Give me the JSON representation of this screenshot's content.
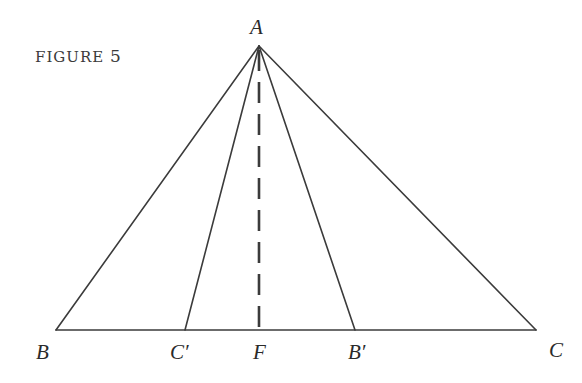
{
  "caption": {
    "word": "FIGURE",
    "number": "5"
  },
  "diagram": {
    "stroke_color": "#3b3b3b",
    "points": {
      "A": {
        "label": "A",
        "x": 259,
        "y": 46
      },
      "B": {
        "label": "B",
        "x": 56,
        "y": 330
      },
      "C": {
        "label": "C",
        "x": 536,
        "y": 330
      },
      "C_prime": {
        "label": "C′",
        "x": 185,
        "y": 330
      },
      "B_prime": {
        "label": "B′",
        "x": 355,
        "y": 330
      },
      "F": {
        "label": "F",
        "x": 259,
        "y": 330
      }
    },
    "segments": [
      {
        "from": "A",
        "to": "B",
        "style": "solid"
      },
      {
        "from": "A",
        "to": "C",
        "style": "solid"
      },
      {
        "from": "B",
        "to": "C",
        "style": "solid"
      },
      {
        "from": "A",
        "to": "C_prime",
        "style": "solid"
      },
      {
        "from": "A",
        "to": "B_prime",
        "style": "solid"
      },
      {
        "from": "A",
        "to": "F",
        "style": "dashed"
      }
    ]
  }
}
